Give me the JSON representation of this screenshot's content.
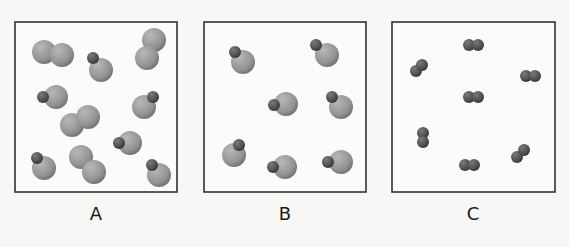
{
  "colors": {
    "background": "#f7f7f5",
    "box_fill": "#fbfbfa",
    "box_stroke": "#333333",
    "large_atom": "#9a9a9a",
    "small_atom": "#555555"
  },
  "panels": [
    {
      "label": "A",
      "box": {
        "x": 15,
        "y": 22,
        "w": 162,
        "h": 170
      },
      "label_x": 96,
      "molecules": [
        {
          "type": "large-diatomic",
          "atoms": [
            {
              "cx": 44,
              "cy": 52,
              "r": 12
            },
            {
              "cx": 62,
              "cy": 55,
              "r": 12
            }
          ]
        },
        {
          "type": "large-diatomic",
          "atoms": [
            {
              "cx": 154,
              "cy": 40,
              "r": 12
            },
            {
              "cx": 147,
              "cy": 58,
              "r": 12
            }
          ]
        },
        {
          "type": "heteronuclear",
          "atoms": [
            {
              "cx": 101,
              "cy": 70,
              "r": 12
            },
            {
              "cx": 93,
              "cy": 58,
              "r": 6
            }
          ]
        },
        {
          "type": "heteronuclear",
          "atoms": [
            {
              "cx": 56,
              "cy": 97,
              "r": 12
            },
            {
              "cx": 43,
              "cy": 97,
              "r": 6
            }
          ]
        },
        {
          "type": "heteronuclear",
          "atoms": [
            {
              "cx": 144,
              "cy": 107,
              "r": 12
            },
            {
              "cx": 153,
              "cy": 97,
              "r": 6
            }
          ]
        },
        {
          "type": "large-diatomic",
          "atoms": [
            {
              "cx": 72,
              "cy": 125,
              "r": 12
            },
            {
              "cx": 88,
              "cy": 117,
              "r": 12
            }
          ]
        },
        {
          "type": "heteronuclear",
          "atoms": [
            {
              "cx": 130,
              "cy": 143,
              "r": 12
            },
            {
              "cx": 119,
              "cy": 143,
              "r": 6
            }
          ]
        },
        {
          "type": "heteronuclear",
          "atoms": [
            {
              "cx": 44,
              "cy": 168,
              "r": 12
            },
            {
              "cx": 37,
              "cy": 158,
              "r": 6
            }
          ]
        },
        {
          "type": "large-diatomic",
          "atoms": [
            {
              "cx": 81,
              "cy": 157,
              "r": 12
            },
            {
              "cx": 94,
              "cy": 172,
              "r": 12
            }
          ]
        },
        {
          "type": "heteronuclear",
          "atoms": [
            {
              "cx": 159,
              "cy": 175,
              "r": 12
            },
            {
              "cx": 152,
              "cy": 165,
              "r": 6
            }
          ]
        }
      ]
    },
    {
      "label": "B",
      "box": {
        "x": 204,
        "y": 22,
        "w": 162,
        "h": 170
      },
      "label_x": 285,
      "molecules": [
        {
          "type": "heteronuclear",
          "atoms": [
            {
              "cx": 243,
              "cy": 62,
              "r": 12
            },
            {
              "cx": 235,
              "cy": 52,
              "r": 6
            }
          ]
        },
        {
          "type": "heteronuclear",
          "atoms": [
            {
              "cx": 327,
              "cy": 55,
              "r": 12
            },
            {
              "cx": 316,
              "cy": 45,
              "r": 6
            }
          ]
        },
        {
          "type": "heteronuclear",
          "atoms": [
            {
              "cx": 286,
              "cy": 104,
              "r": 12
            },
            {
              "cx": 274,
              "cy": 105,
              "r": 6
            }
          ]
        },
        {
          "type": "heteronuclear",
          "atoms": [
            {
              "cx": 341,
              "cy": 107,
              "r": 12
            },
            {
              "cx": 332,
              "cy": 97,
              "r": 6
            }
          ]
        },
        {
          "type": "heteronuclear",
          "atoms": [
            {
              "cx": 234,
              "cy": 155,
              "r": 12
            },
            {
              "cx": 239,
              "cy": 145,
              "r": 6
            }
          ]
        },
        {
          "type": "heteronuclear",
          "atoms": [
            {
              "cx": 285,
              "cy": 167,
              "r": 12
            },
            {
              "cx": 273,
              "cy": 167,
              "r": 6
            }
          ]
        },
        {
          "type": "heteronuclear",
          "atoms": [
            {
              "cx": 341,
              "cy": 162,
              "r": 12
            },
            {
              "cx": 328,
              "cy": 162,
              "r": 6
            }
          ]
        }
      ]
    },
    {
      "label": "C",
      "box": {
        "x": 392,
        "y": 22,
        "w": 163,
        "h": 170
      },
      "label_x": 473,
      "molecules": [
        {
          "type": "small-diatomic",
          "atoms": [
            {
              "cx": 469,
              "cy": 45,
              "r": 6
            },
            {
              "cx": 478,
              "cy": 45,
              "r": 6
            }
          ]
        },
        {
          "type": "small-diatomic",
          "atoms": [
            {
              "cx": 416,
              "cy": 71,
              "r": 6
            },
            {
              "cx": 422,
              "cy": 65,
              "r": 6
            }
          ]
        },
        {
          "type": "small-diatomic",
          "atoms": [
            {
              "cx": 526,
              "cy": 76,
              "r": 6
            },
            {
              "cx": 535,
              "cy": 76,
              "r": 6
            }
          ]
        },
        {
          "type": "small-diatomic",
          "atoms": [
            {
              "cx": 469,
              "cy": 97,
              "r": 6
            },
            {
              "cx": 478,
              "cy": 97,
              "r": 6
            }
          ]
        },
        {
          "type": "small-diatomic",
          "atoms": [
            {
              "cx": 423,
              "cy": 133,
              "r": 6
            },
            {
              "cx": 423,
              "cy": 142,
              "r": 6
            }
          ]
        },
        {
          "type": "small-diatomic",
          "atoms": [
            {
              "cx": 517,
              "cy": 157,
              "r": 6
            },
            {
              "cx": 524,
              "cy": 150,
              "r": 6
            }
          ]
        },
        {
          "type": "small-diatomic",
          "atoms": [
            {
              "cx": 465,
              "cy": 165,
              "r": 6
            },
            {
              "cx": 474,
              "cy": 165,
              "r": 6
            }
          ]
        }
      ]
    }
  ]
}
